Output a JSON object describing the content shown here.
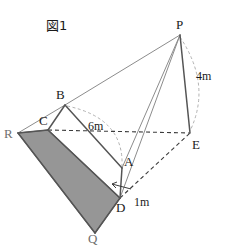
{
  "figure": {
    "title": "図1",
    "caption_lang": "ja",
    "colors": {
      "shaded_face_fill": "#969696",
      "shaded_face_stroke": "#5a5a5a",
      "solid_line": "#555555",
      "light_line": "#8c8c8c",
      "hidden_line": "#3c3c3c",
      "arc_line": "#a9a9a9",
      "label_text": "#1a1a1a",
      "label_faint": "#6f6f6f",
      "background": "#ffffff"
    },
    "vertices": [
      {
        "id": "P",
        "label": "P",
        "x": 180,
        "y": 35,
        "label_x": 176,
        "label_y": 18,
        "faint": false
      },
      {
        "id": "E",
        "label": "E",
        "x": 190,
        "y": 133,
        "label_x": 192,
        "label_y": 138,
        "faint": false
      },
      {
        "id": "B",
        "label": "B",
        "x": 65,
        "y": 105,
        "label_x": 56,
        "label_y": 88,
        "faint": false
      },
      {
        "id": "C",
        "label": "C",
        "x": 48,
        "y": 130,
        "label_x": 39,
        "label_y": 114,
        "faint": false
      },
      {
        "id": "R",
        "label": "R",
        "x": 18,
        "y": 133,
        "label_x": 4,
        "label_y": 127,
        "faint": true
      },
      {
        "id": "A",
        "label": "A",
        "x": 122,
        "y": 168,
        "label_x": 124,
        "label_y": 155,
        "faint": false
      },
      {
        "id": "D",
        "label": "D",
        "x": 120,
        "y": 198,
        "label_x": 116,
        "label_y": 201,
        "faint": false
      },
      {
        "id": "Q",
        "label": "Q",
        "x": 95,
        "y": 233,
        "label_x": 88,
        "label_y": 232,
        "faint": true
      }
    ],
    "dimensions": [
      {
        "id": "height-pe",
        "label": "4m",
        "label_x": 196,
        "label_y": 70,
        "from": "P",
        "to": "E"
      },
      {
        "id": "span-ba",
        "label": "6m",
        "label_x": 88,
        "label_y": 120,
        "from": "B",
        "to": "A"
      },
      {
        "id": "height-ad",
        "label": "1m",
        "label_x": 134,
        "label_y": 196,
        "from": "A",
        "to": "D"
      }
    ],
    "edges_solid": [
      {
        "id": "edge-P-B",
        "from": "P",
        "to": "B",
        "weight": "light"
      },
      {
        "id": "edge-P-A",
        "from": "P",
        "to": "A",
        "weight": "light"
      },
      {
        "id": "edge-P-D",
        "from": "P",
        "to": "D",
        "weight": "light"
      },
      {
        "id": "edge-P-E",
        "from": "P",
        "to": "E",
        "weight": "heavy"
      },
      {
        "id": "edge-R-B",
        "from": "R",
        "to": "B",
        "weight": "light"
      },
      {
        "id": "edge-R-C",
        "from": "R",
        "to": "C",
        "weight": "heavy"
      },
      {
        "id": "edge-B-C",
        "from": "B",
        "to": "C",
        "weight": "heavy"
      },
      {
        "id": "edge-B-A",
        "from": "B",
        "to": "A",
        "weight": "heavy"
      },
      {
        "id": "edge-A-D",
        "from": "A",
        "to": "D",
        "weight": "heavy"
      },
      {
        "id": "edge-C-D",
        "from": "C",
        "to": "D",
        "weight": "heavy"
      },
      {
        "id": "edge-R-Q",
        "from": "R",
        "to": "Q",
        "weight": "heavy"
      },
      {
        "id": "edge-Q-D",
        "from": "Q",
        "to": "D",
        "weight": "heavy"
      }
    ],
    "edges_hidden": [
      {
        "id": "edge-C-E",
        "from": "C",
        "to": "E"
      },
      {
        "id": "edge-D-E",
        "from": "D",
        "to": "E"
      }
    ],
    "shaded_face": {
      "id": "face-RCDQ",
      "vertices": [
        "R",
        "C",
        "D",
        "Q"
      ],
      "label": "shaded base face"
    },
    "arcs": [
      {
        "id": "arc-4m",
        "label": "arc from P to E",
        "d": "M 180 37 Q 212 85 190 131"
      },
      {
        "id": "arc-6m",
        "label": "arc from B to A",
        "d": "M 67 106 Q 124 118 122 166"
      }
    ],
    "arrow_1m": {
      "id": "arrow-ad",
      "d": "M 112 184 L 131 189"
    }
  }
}
